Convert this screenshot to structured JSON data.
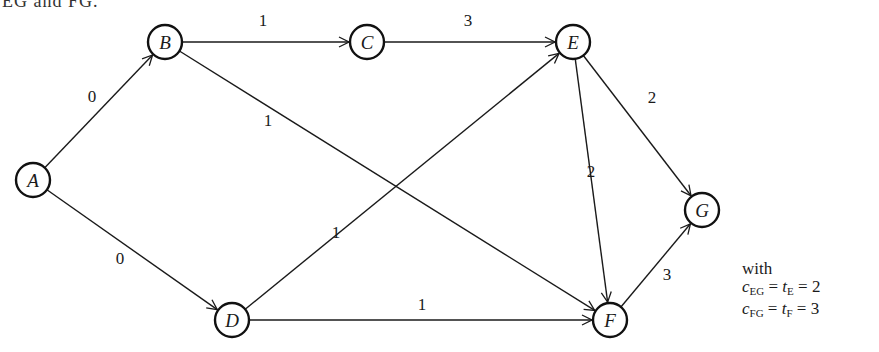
{
  "cropped_header_text": "EG and FG.",
  "diagram": {
    "type": "directed-network",
    "nodes": [
      {
        "id": "A",
        "label": "A",
        "x": 33,
        "y": 180
      },
      {
        "id": "B",
        "label": "B",
        "x": 165,
        "y": 42
      },
      {
        "id": "C",
        "label": "C",
        "x": 367,
        "y": 42
      },
      {
        "id": "E",
        "label": "E",
        "x": 573,
        "y": 42
      },
      {
        "id": "G",
        "label": "G",
        "x": 702,
        "y": 210
      },
      {
        "id": "D",
        "label": "D",
        "x": 232,
        "y": 320
      },
      {
        "id": "F",
        "label": "F",
        "x": 610,
        "y": 320
      }
    ],
    "edges": [
      {
        "from": "A",
        "to": "B",
        "weight": "0"
      },
      {
        "from": "A",
        "to": "D",
        "weight": "0"
      },
      {
        "from": "B",
        "to": "C",
        "weight": "1"
      },
      {
        "from": "B",
        "to": "F",
        "weight": "1"
      },
      {
        "from": "C",
        "to": "E",
        "weight": "3"
      },
      {
        "from": "D",
        "to": "E",
        "weight": "1"
      },
      {
        "from": "D",
        "to": "F",
        "weight": "1"
      },
      {
        "from": "E",
        "to": "G",
        "weight": "2"
      },
      {
        "from": "E",
        "to": "F",
        "weight": "2"
      },
      {
        "from": "F",
        "to": "G",
        "weight": "3"
      }
    ]
  },
  "note": {
    "intro": "with",
    "lines": [
      {
        "c_sub": "EG",
        "t_sub": "E",
        "value": "2"
      },
      {
        "c_sub": "FG",
        "t_sub": "F",
        "value": "3"
      }
    ]
  }
}
